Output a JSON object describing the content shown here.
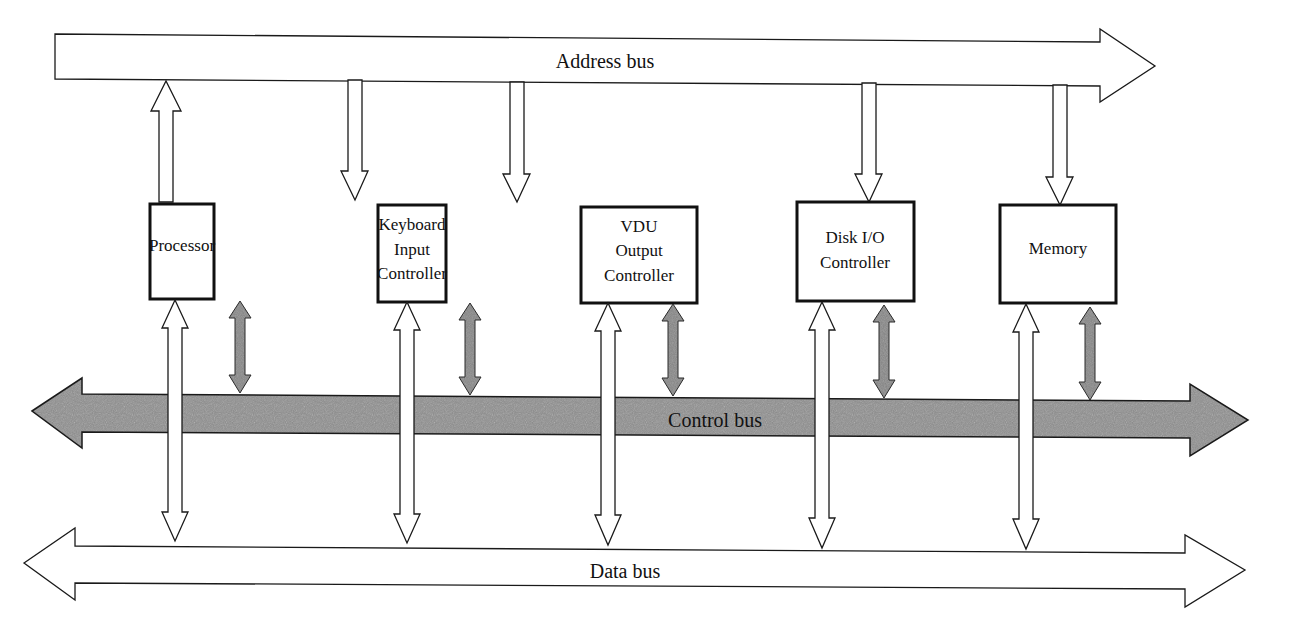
{
  "diagram": {
    "buses": {
      "address": {
        "label": "Address bus",
        "direction": "right"
      },
      "control": {
        "label": "Control bus",
        "direction": "bidirectional",
        "fill": "#8a8a8a"
      },
      "data": {
        "label": "Data bus",
        "direction": "bidirectional"
      }
    },
    "components": [
      {
        "id": "processor",
        "lines": [
          "Processor"
        ],
        "address_link": "to-bus",
        "data_link": "bidirectional",
        "control_link": "bidirectional"
      },
      {
        "id": "keyboard",
        "lines": [
          "Keyboard",
          "Input",
          "Controller"
        ],
        "address_link": "from-bus",
        "data_link": "bidirectional",
        "control_link": "bidirectional"
      },
      {
        "id": "vdu",
        "lines": [
          "VDU",
          "Output",
          "Controller"
        ],
        "address_link": "from-bus",
        "data_link": "bidirectional",
        "control_link": "bidirectional"
      },
      {
        "id": "disk",
        "lines": [
          "Disk I/O",
          "Controller"
        ],
        "address_link": "from-bus",
        "data_link": "bidirectional",
        "control_link": "bidirectional"
      },
      {
        "id": "memory",
        "lines": [
          "Memory"
        ],
        "address_link": "from-bus",
        "data_link": "bidirectional",
        "control_link": "bidirectional"
      }
    ],
    "colors": {
      "line": "#1a1a1a",
      "control_fill": "#8a8a8a",
      "background": "#ffffff"
    }
  }
}
